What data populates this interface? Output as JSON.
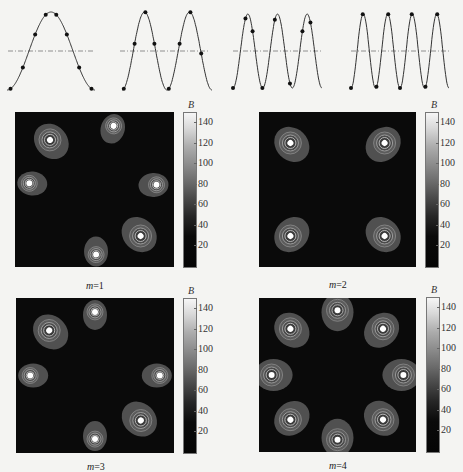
{
  "chart_data": [
    {
      "type": "line",
      "title": "Waveform m=1",
      "mode": 1,
      "description": "cosine waveform with dash-dot zero line and 6 sample points",
      "cycles": 1
    },
    {
      "type": "line",
      "title": "Waveform m=2",
      "mode": 2,
      "description": "cosine waveform with dash-dot zero line and 8 sample points",
      "cycles": 2
    },
    {
      "type": "line",
      "title": "Waveform m=3",
      "mode": 3,
      "description": "cosine waveform with dash-dot zero line and 8 sample points",
      "cycles": 3
    },
    {
      "type": "line",
      "title": "Waveform m=4",
      "mode": 4,
      "description": "cosine waveform with dash-dot zero line and 8 sample points",
      "cycles": 4
    },
    {
      "type": "heatmap",
      "label": "m=1",
      "colorbar": {
        "title": "B",
        "ticks": [
          20,
          40,
          60,
          80,
          100,
          120,
          140
        ],
        "range": [
          0,
          150
        ]
      },
      "spots": [
        {
          "x": 0.62,
          "y": 0.09,
          "size": "small"
        },
        {
          "x": 0.22,
          "y": 0.18,
          "size": "large"
        },
        {
          "x": 0.89,
          "y": 0.47,
          "size": "small"
        },
        {
          "x": 0.09,
          "y": 0.46,
          "size": "small"
        },
        {
          "x": 0.79,
          "y": 0.8,
          "size": "large"
        },
        {
          "x": 0.51,
          "y": 0.92,
          "size": "small"
        }
      ]
    },
    {
      "type": "heatmap",
      "label": "m=2",
      "colorbar": {
        "title": "B",
        "ticks": [
          20,
          40,
          60,
          80,
          100,
          120,
          140
        ],
        "range": [
          0,
          150
        ]
      },
      "spots": [
        {
          "x": 0.2,
          "y": 0.2,
          "size": "large"
        },
        {
          "x": 0.8,
          "y": 0.2,
          "size": "large"
        },
        {
          "x": 0.2,
          "y": 0.8,
          "size": "large"
        },
        {
          "x": 0.8,
          "y": 0.8,
          "size": "large"
        }
      ]
    },
    {
      "type": "heatmap",
      "label": "m=3",
      "colorbar": {
        "title": "B",
        "ticks": [
          20,
          40,
          60,
          80,
          100,
          120,
          140
        ],
        "range": [
          0,
          150
        ]
      },
      "spots": [
        {
          "x": 0.5,
          "y": 0.09,
          "size": "small"
        },
        {
          "x": 0.21,
          "y": 0.21,
          "size": "large"
        },
        {
          "x": 0.09,
          "y": 0.5,
          "size": "small"
        },
        {
          "x": 0.91,
          "y": 0.5,
          "size": "small"
        },
        {
          "x": 0.79,
          "y": 0.79,
          "size": "large"
        },
        {
          "x": 0.5,
          "y": 0.91,
          "size": "small"
        }
      ]
    },
    {
      "type": "heatmap",
      "label": "m=4",
      "colorbar": {
        "title": "B",
        "ticks": [
          20,
          40,
          60,
          80,
          100,
          120,
          140
        ],
        "range": [
          0,
          150
        ]
      },
      "spots": [
        {
          "x": 0.5,
          "y": 0.08,
          "size": "large"
        },
        {
          "x": 0.79,
          "y": 0.2,
          "size": "large"
        },
        {
          "x": 0.92,
          "y": 0.5,
          "size": "large"
        },
        {
          "x": 0.79,
          "y": 0.79,
          "size": "large"
        },
        {
          "x": 0.5,
          "y": 0.92,
          "size": "large"
        },
        {
          "x": 0.2,
          "y": 0.79,
          "size": "large"
        },
        {
          "x": 0.08,
          "y": 0.5,
          "size": "large"
        },
        {
          "x": 0.2,
          "y": 0.2,
          "size": "large"
        }
      ]
    }
  ],
  "panels": [
    {
      "label_prefix": "m",
      "label_value": "=1",
      "colorbar_title": "B"
    },
    {
      "label_prefix": "m",
      "label_value": "=2",
      "colorbar_title": "B"
    },
    {
      "label_prefix": "m",
      "label_value": "=3",
      "colorbar_title": "B"
    },
    {
      "label_prefix": "m",
      "label_value": "=4",
      "colorbar_title": "B"
    }
  ],
  "colorbar_ticks": [
    "140",
    "120",
    "100",
    "80",
    "60",
    "40",
    "20"
  ]
}
